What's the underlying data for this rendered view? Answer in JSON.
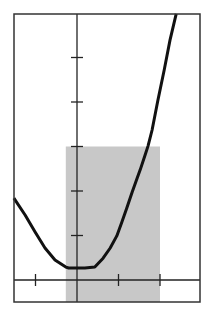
{
  "chart_data": {
    "type": "line",
    "title": "",
    "xlabel": "",
    "ylabel": "",
    "grid": false,
    "legend": null,
    "xlim": [
      -1.52,
      2.96
    ],
    "ylim": [
      -0.5,
      6.0
    ],
    "x_ticks": [
      -1,
      1,
      2
    ],
    "y_ticks": [
      1,
      2,
      3,
      4,
      5
    ],
    "shaded_region": {
      "x_from": -0.27,
      "x_to": 2.0,
      "y_from": -0.5,
      "y_to": 3.0,
      "color": "#c8c8c8"
    },
    "series": [
      {
        "name": "curve",
        "color": "#111111",
        "points": [
          [
            -1.52,
            1.84
          ],
          [
            -1.25,
            1.46
          ],
          [
            -1.01,
            1.08
          ],
          [
            -0.77,
            0.72
          ],
          [
            -0.53,
            0.45
          ],
          [
            -0.27,
            0.29
          ],
          [
            -0.2,
            0.27
          ],
          [
            0.0,
            0.27
          ],
          [
            0.19,
            0.27
          ],
          [
            0.43,
            0.29
          ],
          [
            0.63,
            0.49
          ],
          [
            0.8,
            0.72
          ],
          [
            0.96,
            0.99
          ],
          [
            1.08,
            1.3
          ],
          [
            1.2,
            1.62
          ],
          [
            1.33,
            1.98
          ],
          [
            1.45,
            2.29
          ],
          [
            1.52,
            2.47
          ],
          [
            1.64,
            2.81
          ],
          [
            1.71,
            3.01
          ],
          [
            1.81,
            3.37
          ],
          [
            1.95,
            4.04
          ],
          [
            2.1,
            4.72
          ],
          [
            2.24,
            5.39
          ],
          [
            2.39,
            5.98
          ]
        ]
      }
    ]
  },
  "colors": {
    "frame": "#333333",
    "axis": "#222222",
    "shade": "#c8c8c8",
    "background": "#ffffff"
  }
}
